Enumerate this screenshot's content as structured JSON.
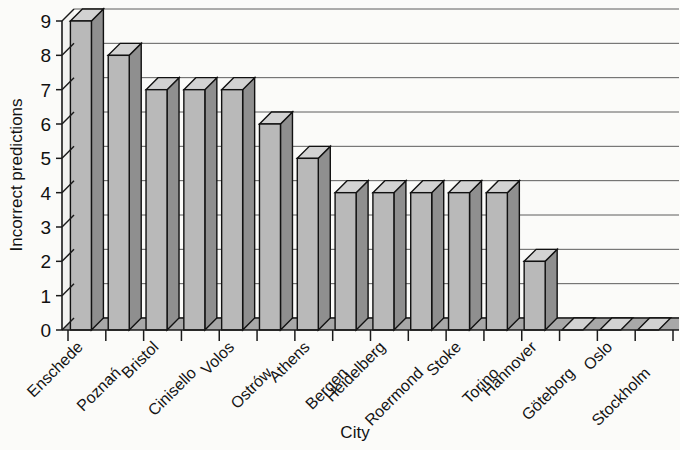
{
  "chart_data": {
    "type": "bar",
    "title": "",
    "xlabel": "City",
    "ylabel": "Incorrect predictions",
    "categories": [
      "Enschede",
      "Poznań",
      "Bristol",
      "Cinisello",
      "Volos",
      "Ostrów",
      "Athens",
      "Bergen",
      "Heidelberg",
      "Roermond",
      "Stoke",
      "Torino",
      "Hannover",
      "Göteborg",
      "Oslo",
      "Stockholm"
    ],
    "values": [
      9,
      8,
      7,
      7,
      7,
      6,
      5,
      4,
      4,
      4,
      4,
      4,
      2,
      0,
      0,
      0
    ],
    "ylim": [
      0,
      9
    ],
    "ytick_labels": [
      "0",
      "1",
      "2",
      "3",
      "4",
      "5",
      "6",
      "7",
      "8",
      "9"
    ],
    "ytick_values": [
      0,
      1,
      2,
      3,
      4,
      5,
      6,
      7,
      8,
      9
    ],
    "grid": true,
    "legend": false,
    "style": "3d-bars",
    "bar_color": "#b9b9b9",
    "bar_side_color": "#8f8f8f",
    "bar_top_color": "#d2d2d2",
    "outline_color": "#111111",
    "background_color": "#fbfbf9"
  }
}
